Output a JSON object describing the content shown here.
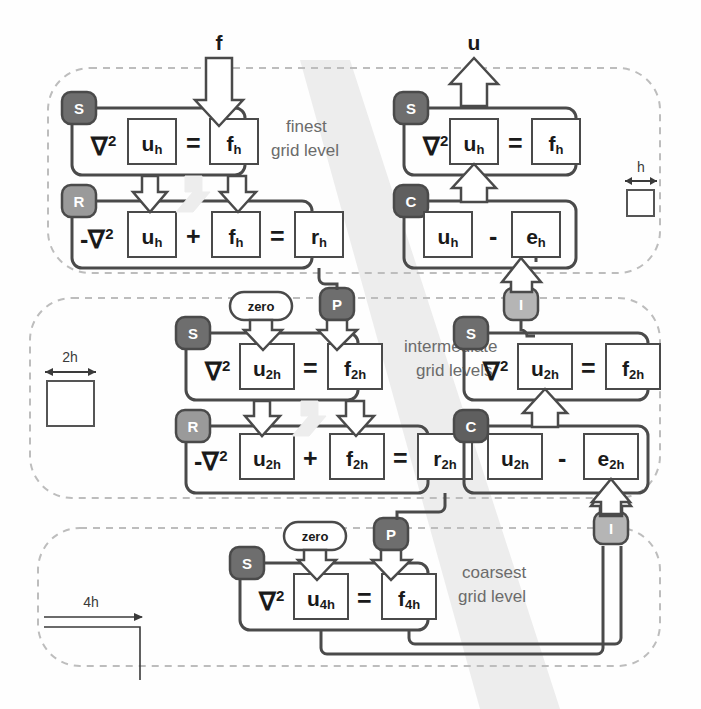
{
  "figure": {
    "background": "#fefefe",
    "colors": {
      "box_stroke": "#4a4a4a",
      "group_stroke": "#4a4a4a",
      "dashed_stroke": "#bdbdbd",
      "badge_dark": "#6e6e6e",
      "badge_mid": "#8f8f8f",
      "badge_light": "#b5b5b5",
      "arrow_fill": "#ffffff",
      "arrow_stroke": "#4a4a4a",
      "text": "#1a1a1a",
      "label_text": "#6b6b6b",
      "shadow_band": "#ededed"
    }
  },
  "io": {
    "input_label": "f",
    "output_label": "u"
  },
  "levels": [
    {
      "id": "finest",
      "label_line1": "finest",
      "label_line2": "grid level",
      "scale_label": "h",
      "scale_kind": "square",
      "left_column": {
        "smooth_badge": "S",
        "restrict_badge": "R",
        "smooth_equation": [
          "∇",
          "2",
          "u",
          "h",
          "=",
          "f",
          "h"
        ],
        "smooth_terms": [
          {
            "op": "∇²",
            "box": "u",
            "sub": "h"
          },
          {
            "op": "=",
            "box": "f",
            "sub": "h"
          }
        ],
        "residual_terms": [
          {
            "op": "-∇²",
            "box": "u",
            "sub": "h"
          },
          {
            "op": "+",
            "box": "f",
            "sub": "h"
          },
          {
            "op": "=",
            "box": "r",
            "sub": "h"
          }
        ]
      },
      "right_column": {
        "smooth_badge": "S",
        "correct_badge": "C",
        "smooth_terms": [
          {
            "op": "∇²",
            "box": "u",
            "sub": "h"
          },
          {
            "op": "=",
            "box": "f",
            "sub": "h"
          }
        ],
        "correct_terms": [
          {
            "op": "",
            "box": "u",
            "sub": "h"
          },
          {
            "op": "-",
            "box": "e",
            "sub": "h"
          }
        ]
      }
    },
    {
      "id": "intermediate",
      "label_line1": "intermediate",
      "label_line2": "grid levels",
      "scale_label": "2h",
      "scale_kind": "square",
      "zero_label": "zero",
      "prolong_badge": "P",
      "interp_badge": "I",
      "left_column": {
        "smooth_badge": "S",
        "restrict_badge": "R",
        "smooth_terms": [
          {
            "op": "∇²",
            "box": "u",
            "sub": "2h"
          },
          {
            "op": "=",
            "box": "f",
            "sub": "2h"
          }
        ],
        "residual_terms": [
          {
            "op": "-∇²",
            "box": "u",
            "sub": "2h"
          },
          {
            "op": "+",
            "box": "f",
            "sub": "2h"
          },
          {
            "op": "=",
            "box": "r",
            "sub": "2h"
          }
        ]
      },
      "right_column": {
        "smooth_badge": "S",
        "correct_badge": "C",
        "smooth_terms": [
          {
            "op": "∇²",
            "box": "u",
            "sub": "2h"
          },
          {
            "op": "=",
            "box": "f",
            "sub": "2h"
          }
        ],
        "correct_terms": [
          {
            "op": "",
            "box": "u",
            "sub": "2h"
          },
          {
            "op": "-",
            "box": "e",
            "sub": "2h"
          }
        ]
      }
    },
    {
      "id": "coarsest",
      "label_line1": "coarsest",
      "label_line2": "grid level",
      "scale_label": "4h",
      "scale_kind": "arrow",
      "zero_label": "zero",
      "prolong_badge": "P",
      "interp_badge": "I",
      "center_column": {
        "smooth_badge": "S",
        "smooth_terms": [
          {
            "op": "∇²",
            "box": "u",
            "sub": "4h"
          },
          {
            "op": "=",
            "box": "f",
            "sub": "4h"
          }
        ]
      }
    }
  ],
  "badges": {
    "S": {
      "name": "smooth",
      "letter": "S",
      "fill": "#6e6e6e"
    },
    "R": {
      "name": "restrict",
      "letter": "R",
      "fill": "#9a9a9a"
    },
    "C": {
      "name": "correct",
      "letter": "C",
      "fill": "#5f5f5f"
    },
    "P": {
      "name": "prolongate",
      "letter": "P",
      "fill": "#6e6e6e"
    },
    "I": {
      "name": "interpolate",
      "letter": "I",
      "fill": "#b5b5b5"
    }
  }
}
